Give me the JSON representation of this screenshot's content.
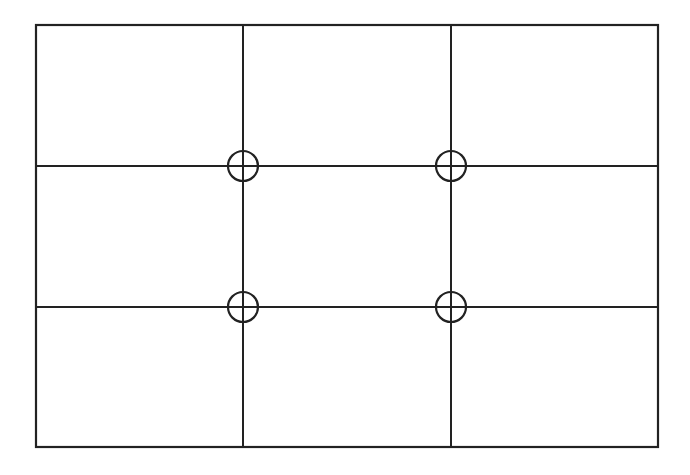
{
  "diagram": {
    "type": "rule-of-thirds-grid",
    "rows": 3,
    "columns": 3,
    "frame": {
      "x1": 36,
      "y1": 25,
      "x2": 658,
      "y2": 447
    },
    "vertical_lines_x": [
      243,
      451
    ],
    "horizontal_lines_y": [
      166,
      307
    ],
    "intersections": [
      {
        "x": 243,
        "y": 166
      },
      {
        "x": 451,
        "y": 166
      },
      {
        "x": 243,
        "y": 307
      },
      {
        "x": 451,
        "y": 307
      }
    ],
    "intersection_marker": "circle-crosshair",
    "marker_radius": 15,
    "line_color": "#222222",
    "background_color": "#ffffff"
  }
}
